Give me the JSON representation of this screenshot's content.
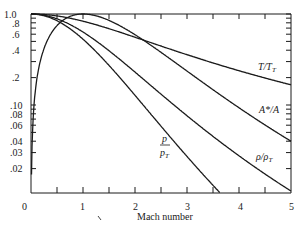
{
  "chart_data": {
    "type": "line",
    "title": "",
    "xlabel": "Mach number",
    "ylabel": "",
    "xlim": [
      0,
      5
    ],
    "ylim": [
      0.011,
      1.0
    ],
    "yscale": "log",
    "grid": false,
    "legend": "inline labels",
    "x_ticks": [
      "0",
      "1",
      "2",
      "3",
      "4",
      "5"
    ],
    "y_ticks": [
      "1.0",
      ".8",
      ".6",
      ".4",
      ".2",
      ".10",
      ".08",
      ".06",
      ".04",
      ".03",
      ".02"
    ],
    "x": [
      0,
      0.5,
      1,
      1.5,
      2,
      2.5,
      3,
      3.5,
      4,
      4.5,
      5
    ],
    "series": [
      {
        "name": "T/T_T",
        "label_main": "T/T",
        "label_sub": "T",
        "values": [
          1.0,
          0.952,
          0.833,
          0.69,
          0.556,
          0.444,
          0.357,
          0.29,
          0.238,
          0.198,
          0.167
        ]
      },
      {
        "name": "A*/A",
        "label_main": "A*/A",
        "label_sub": "",
        "values": [
          0.0,
          0.74,
          1.0,
          0.85,
          0.593,
          0.379,
          0.236,
          0.147,
          0.094,
          0.06,
          0.04
        ]
      },
      {
        "name": "ρ/ρ_T",
        "label_main": "ρ/ρ",
        "label_sub": "T",
        "values": [
          1.0,
          0.885,
          0.634,
          0.395,
          0.23,
          0.132,
          0.0762,
          0.0452,
          0.0277,
          0.0174,
          0.0113
        ]
      },
      {
        "name": "p/p_T",
        "label_main": "p",
        "label_den": "p",
        "label_sub": "T",
        "values": [
          1.0,
          0.843,
          0.528,
          0.272,
          0.128,
          0.0585,
          0.0272,
          0.0131,
          0.0066,
          0.0035,
          0.0019
        ]
      }
    ]
  },
  "labels": {
    "x_title": "Mach number",
    "x0": "0",
    "x1": "1",
    "x2": "2",
    "x3": "3",
    "x4": "4",
    "x5": "5",
    "y10": "1.0",
    "y08": ".8",
    "y06": ".6",
    "y04": ".4",
    "y02": ".2",
    "y010": ".10",
    "y008": ".08",
    "y006": ".06",
    "y004": ".04",
    "y003": ".03",
    "y002": ".02",
    "tt_main": "T/T",
    "tt_sub": "T",
    "astar": "A*/A",
    "rho_main": "ρ/ρ",
    "rho_sub": "T",
    "p_num": "p",
    "p_den": "p",
    "p_sub": "T"
  }
}
